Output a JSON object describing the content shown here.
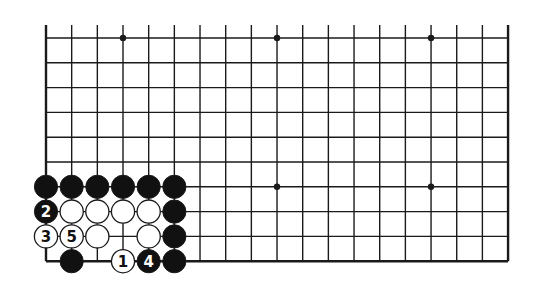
{
  "diagram": {
    "type": "go-board-fragment",
    "colors": {
      "background": "#ffffff",
      "line": "#1a1a1a",
      "black_stone": "#111111",
      "white_stone": "#ffffff",
      "label_on_black": "#ffffff",
      "label_on_white": "#111111"
    },
    "grid": {
      "columns": 19,
      "rows": 10,
      "origin_x": 46,
      "origin_y": 38,
      "spacing_x": 25.67,
      "spacing_y": 24.8,
      "top_edge_open": true,
      "left_edge": true,
      "right_edge": true,
      "bottom_edge": true
    },
    "star_points": [
      {
        "col": 3,
        "row": 0
      },
      {
        "col": 9,
        "row": 0
      },
      {
        "col": 15,
        "row": 0
      },
      {
        "col": 3,
        "row": 6
      },
      {
        "col": 9,
        "row": 6
      },
      {
        "col": 15,
        "row": 6
      }
    ],
    "stones": [
      {
        "col": 0,
        "row": 6,
        "color": "black",
        "label": ""
      },
      {
        "col": 1,
        "row": 6,
        "color": "black",
        "label": ""
      },
      {
        "col": 2,
        "row": 6,
        "color": "black",
        "label": ""
      },
      {
        "col": 3,
        "row": 6,
        "color": "black",
        "label": ""
      },
      {
        "col": 4,
        "row": 6,
        "color": "black",
        "label": ""
      },
      {
        "col": 5,
        "row": 6,
        "color": "black",
        "label": ""
      },
      {
        "col": 0,
        "row": 7,
        "color": "black",
        "label": "2"
      },
      {
        "col": 1,
        "row": 7,
        "color": "white",
        "label": ""
      },
      {
        "col": 2,
        "row": 7,
        "color": "white",
        "label": ""
      },
      {
        "col": 3,
        "row": 7,
        "color": "white",
        "label": ""
      },
      {
        "col": 4,
        "row": 7,
        "color": "white",
        "label": ""
      },
      {
        "col": 5,
        "row": 7,
        "color": "black",
        "label": ""
      },
      {
        "col": 0,
        "row": 8,
        "color": "white",
        "label": "3"
      },
      {
        "col": 1,
        "row": 8,
        "color": "white",
        "label": "5"
      },
      {
        "col": 2,
        "row": 8,
        "color": "white",
        "label": ""
      },
      {
        "col": 4,
        "row": 8,
        "color": "white",
        "label": ""
      },
      {
        "col": 5,
        "row": 8,
        "color": "black",
        "label": ""
      },
      {
        "col": 1,
        "row": 9,
        "color": "black",
        "label": ""
      },
      {
        "col": 3,
        "row": 9,
        "color": "white",
        "label": "1"
      },
      {
        "col": 4,
        "row": 9,
        "color": "black",
        "label": "4"
      },
      {
        "col": 5,
        "row": 9,
        "color": "black",
        "label": ""
      }
    ]
  }
}
